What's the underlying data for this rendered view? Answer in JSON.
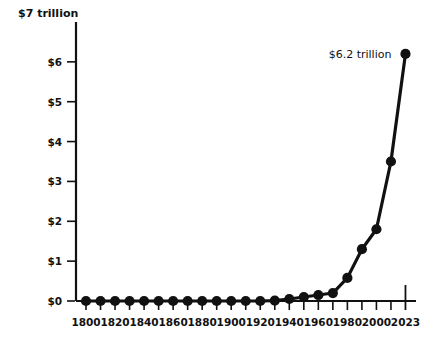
{
  "chart_data": {
    "type": "line",
    "title": "",
    "xlabel": "",
    "ylabel": "$7 trillion",
    "y_axis_top_label": "$7 trillion",
    "ylim": [
      0,
      7
    ],
    "xlim": [
      1800,
      2023
    ],
    "grid": false,
    "legend": "none",
    "ytick_labels": [
      "$0",
      "$1",
      "$2",
      "$3",
      "$4",
      "$5",
      "$6",
      "$7 trillion"
    ],
    "ytick_values": [
      0,
      1,
      2,
      3,
      4,
      5,
      6,
      7
    ],
    "xtick_labels": [
      "1800",
      "1820",
      "1840",
      "1860",
      "1880",
      "1900",
      "1920",
      "1940",
      "1960",
      "1980",
      "2000",
      "2023"
    ],
    "xtick_values": [
      1800,
      1820,
      1840,
      1860,
      1880,
      1900,
      1920,
      1940,
      1960,
      1980,
      2000,
      2023
    ],
    "x": [
      1800,
      1810,
      1820,
      1830,
      1840,
      1850,
      1860,
      1870,
      1880,
      1890,
      1900,
      1910,
      1920,
      1930,
      1940,
      1950,
      1960,
      1970,
      1980,
      1990,
      2000,
      2010,
      2023
    ],
    "values": [
      0.0,
      0.0,
      0.0,
      0.0,
      0.0,
      0.0,
      0.0,
      0.0,
      0.0,
      0.0,
      0.0,
      0.0,
      0.0,
      0.01,
      0.05,
      0.1,
      0.15,
      0.2,
      0.58,
      1.3,
      1.8,
      3.5,
      6.2
    ],
    "units": "trillion dollars",
    "annotations": [
      {
        "text": "$6.2 trillion",
        "x": 2023,
        "y": 6.2
      }
    ],
    "marker": "circle",
    "line_color": "#111111",
    "marker_color": "#111111",
    "background_color": "#ffffff"
  }
}
